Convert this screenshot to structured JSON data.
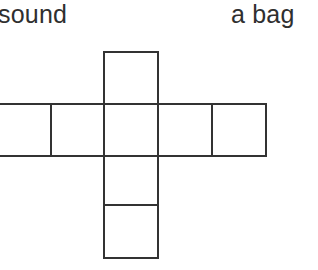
{
  "page": {
    "background_color": "#ffffff",
    "width": 318,
    "height": 270
  },
  "text_fragments": {
    "left_word": "sound",
    "right_words": "a bag",
    "color": "#2f2f2f"
  },
  "net_diagram": {
    "name": "cube-net-cross",
    "stroke_color": "#333333",
    "fill_color": "#ffffff",
    "stroke_width": 2,
    "cell_size": 54,
    "face_count_visible": 8,
    "faces": [
      {
        "id": "top-square",
        "x": 104,
        "y": 52,
        "w": 54,
        "h": 52
      },
      {
        "id": "row-face-1-clipped",
        "x": -4,
        "y": 104,
        "w": 55,
        "h": 52
      },
      {
        "id": "row-face-2",
        "x": 51,
        "y": 104,
        "w": 53,
        "h": 52
      },
      {
        "id": "row-face-3-center",
        "x": 104,
        "y": 104,
        "w": 54,
        "h": 52
      },
      {
        "id": "row-face-4",
        "x": 158,
        "y": 104,
        "w": 54,
        "h": 52
      },
      {
        "id": "row-face-5",
        "x": 212,
        "y": 104,
        "w": 54,
        "h": 52
      },
      {
        "id": "bottom-square-upper",
        "x": 104,
        "y": 156,
        "w": 54,
        "h": 49
      },
      {
        "id": "bottom-square-lower",
        "x": 104,
        "y": 205,
        "w": 54,
        "h": 53
      }
    ]
  }
}
